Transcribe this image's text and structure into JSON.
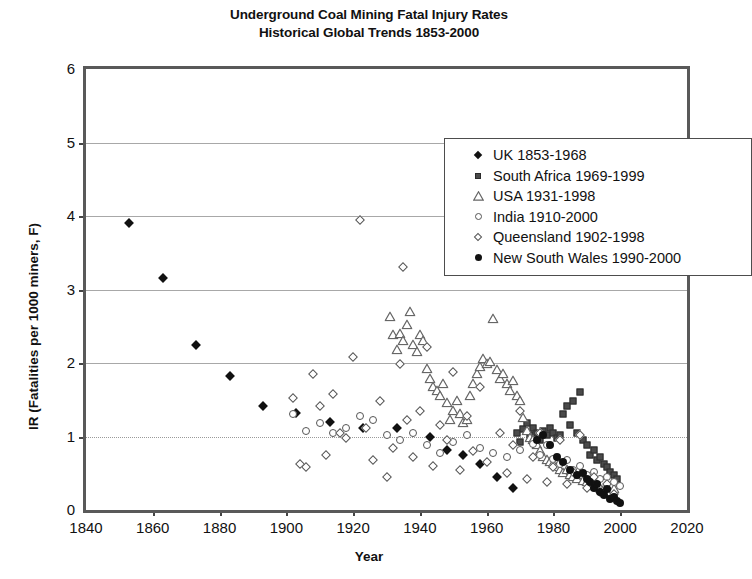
{
  "chart_data": {
    "type": "scatter",
    "title": "Underground Coal Mining Fatal Injury Rates",
    "subtitle": "Historical Global Trends 1853-2000",
    "xlabel": "Year",
    "ylabel": "IR (Fatalities per 1000 miners, F)",
    "xlim": [
      1840,
      2020
    ],
    "ylim": [
      0,
      6
    ],
    "xticks": [
      1840,
      1860,
      1880,
      1900,
      1920,
      1940,
      1960,
      1980,
      2000,
      2020
    ],
    "yticks": [
      0,
      1,
      2,
      3,
      4,
      5,
      6
    ],
    "grid": "horizontal gridlines at 1 (dotted), 2, 3, 4, 5 (solid gray)",
    "legend_position": "top-center-right inside plot",
    "series": [
      {
        "name": "UK 1853-1968",
        "marker": "diamond-filled",
        "color": "#111111",
        "points": [
          [
            1853,
            3.9
          ],
          [
            1863,
            3.15
          ],
          [
            1873,
            2.25
          ],
          [
            1883,
            1.82
          ],
          [
            1893,
            1.42
          ],
          [
            1903,
            1.32
          ],
          [
            1913,
            1.2
          ],
          [
            1923,
            1.12
          ],
          [
            1933,
            1.12
          ],
          [
            1943,
            1.0
          ],
          [
            1948,
            0.82
          ],
          [
            1953,
            0.75
          ],
          [
            1958,
            0.62
          ],
          [
            1963,
            0.45
          ],
          [
            1968,
            0.3
          ]
        ]
      },
      {
        "name": "South Africa 1969-1999",
        "marker": "square-filled",
        "color": "#4a4a4a",
        "points": [
          [
            1969,
            1.05
          ],
          [
            1970,
            0.92
          ],
          [
            1971,
            1.1
          ],
          [
            1972,
            1.18
          ],
          [
            1973,
            1.02
          ],
          [
            1974,
            1.12
          ],
          [
            1975,
            1.05
          ],
          [
            1976,
            0.95
          ],
          [
            1977,
            1.08
          ],
          [
            1978,
            1.02
          ],
          [
            1979,
            1.12
          ],
          [
            1980,
            1.05
          ],
          [
            1981,
            0.98
          ],
          [
            1982,
            1.02
          ],
          [
            1983,
            1.3
          ],
          [
            1984,
            1.42
          ],
          [
            1985,
            1.15
          ],
          [
            1986,
            1.48
          ],
          [
            1987,
            1.05
          ],
          [
            1988,
            1.6
          ],
          [
            1989,
            0.95
          ],
          [
            1990,
            0.88
          ],
          [
            1991,
            0.75
          ],
          [
            1992,
            0.82
          ],
          [
            1993,
            0.68
          ],
          [
            1994,
            0.72
          ],
          [
            1995,
            0.62
          ],
          [
            1996,
            0.58
          ],
          [
            1997,
            0.52
          ],
          [
            1998,
            0.48
          ],
          [
            1999,
            0.42
          ]
        ]
      },
      {
        "name": "USA 1931-1998",
        "marker": "triangle-open",
        "color": "#666666",
        "points": [
          [
            1931,
            2.62
          ],
          [
            1932,
            2.38
          ],
          [
            1933,
            2.18
          ],
          [
            1934,
            2.4
          ],
          [
            1935,
            2.3
          ],
          [
            1936,
            2.52
          ],
          [
            1937,
            2.7
          ],
          [
            1938,
            2.25
          ],
          [
            1939,
            2.15
          ],
          [
            1940,
            2.38
          ],
          [
            1941,
            2.3
          ],
          [
            1942,
            1.92
          ],
          [
            1943,
            1.78
          ],
          [
            1944,
            1.68
          ],
          [
            1945,
            1.62
          ],
          [
            1946,
            1.55
          ],
          [
            1947,
            1.72
          ],
          [
            1948,
            1.45
          ],
          [
            1949,
            1.22
          ],
          [
            1950,
            1.35
          ],
          [
            1951,
            1.48
          ],
          [
            1952,
            1.3
          ],
          [
            1953,
            1.18
          ],
          [
            1954,
            1.22
          ],
          [
            1955,
            1.55
          ],
          [
            1956,
            1.72
          ],
          [
            1957,
            1.85
          ],
          [
            1958,
            1.95
          ],
          [
            1959,
            2.05
          ],
          [
            1960,
            1.98
          ],
          [
            1961,
            2.02
          ],
          [
            1962,
            2.6
          ],
          [
            1963,
            1.9
          ],
          [
            1964,
            1.78
          ],
          [
            1965,
            1.85
          ],
          [
            1966,
            1.72
          ],
          [
            1967,
            1.62
          ],
          [
            1968,
            1.75
          ],
          [
            1969,
            1.55
          ],
          [
            1970,
            1.48
          ],
          [
            1971,
            1.25
          ],
          [
            1972,
            1.08
          ],
          [
            1973,
            0.98
          ],
          [
            1974,
            0.95
          ],
          [
            1975,
            0.88
          ],
          [
            1976,
            0.8
          ],
          [
            1977,
            0.72
          ],
          [
            1978,
            0.68
          ],
          [
            1979,
            0.65
          ],
          [
            1980,
            0.62
          ],
          [
            1981,
            0.58
          ],
          [
            1982,
            0.55
          ],
          [
            1983,
            0.5
          ],
          [
            1984,
            0.55
          ],
          [
            1985,
            0.48
          ],
          [
            1986,
            0.45
          ],
          [
            1987,
            0.42
          ],
          [
            1988,
            0.48
          ],
          [
            1989,
            0.4
          ],
          [
            1990,
            0.38
          ],
          [
            1991,
            0.35
          ],
          [
            1992,
            0.32
          ],
          [
            1993,
            0.35
          ],
          [
            1994,
            0.3
          ],
          [
            1995,
            0.28
          ],
          [
            1996,
            0.3
          ],
          [
            1997,
            0.25
          ],
          [
            1998,
            0.28
          ]
        ]
      },
      {
        "name": "India 1910-2000",
        "marker": "circle-open",
        "color": "#555555",
        "points": [
          [
            1910,
            1.18
          ],
          [
            1914,
            1.05
          ],
          [
            1918,
            1.12
          ],
          [
            1922,
            1.28
          ],
          [
            1926,
            1.22
          ],
          [
            1930,
            1.02
          ],
          [
            1934,
            0.95
          ],
          [
            1938,
            1.05
          ],
          [
            1942,
            0.88
          ],
          [
            1946,
            0.78
          ],
          [
            1950,
            0.92
          ],
          [
            1954,
            1.02
          ],
          [
            1958,
            0.85
          ],
          [
            1962,
            0.78
          ],
          [
            1966,
            0.72
          ],
          [
            1970,
            0.82
          ],
          [
            1974,
            0.9
          ],
          [
            1976,
            0.75
          ],
          [
            1978,
            0.88
          ],
          [
            1980,
            0.7
          ],
          [
            1982,
            0.62
          ],
          [
            1984,
            0.68
          ],
          [
            1986,
            0.55
          ],
          [
            1988,
            0.6
          ],
          [
            1990,
            0.48
          ],
          [
            1992,
            0.52
          ],
          [
            1994,
            0.42
          ],
          [
            1996,
            0.45
          ],
          [
            1998,
            0.38
          ],
          [
            2000,
            0.32
          ],
          [
            1902,
            1.3
          ],
          [
            1906,
            1.08
          ]
        ]
      },
      {
        "name": "Queensland 1902-1998",
        "marker": "diamond-open",
        "color": "#555555",
        "points": [
          [
            1902,
            1.52
          ],
          [
            1904,
            0.62
          ],
          [
            1906,
            0.58
          ],
          [
            1908,
            1.85
          ],
          [
            1910,
            1.42
          ],
          [
            1912,
            0.75
          ],
          [
            1914,
            1.58
          ],
          [
            1916,
            1.05
          ],
          [
            1918,
            0.98
          ],
          [
            1920,
            2.08
          ],
          [
            1922,
            3.95
          ],
          [
            1924,
            1.12
          ],
          [
            1926,
            0.68
          ],
          [
            1928,
            1.48
          ],
          [
            1930,
            0.45
          ],
          [
            1932,
            0.85
          ],
          [
            1934,
            1.98
          ],
          [
            1935,
            3.3
          ],
          [
            1936,
            1.22
          ],
          [
            1938,
            0.72
          ],
          [
            1940,
            1.35
          ],
          [
            1942,
            2.22
          ],
          [
            1944,
            0.6
          ],
          [
            1946,
            1.15
          ],
          [
            1948,
            0.95
          ],
          [
            1950,
            1.88
          ],
          [
            1952,
            0.55
          ],
          [
            1954,
            1.28
          ],
          [
            1956,
            0.8
          ],
          [
            1958,
            1.68
          ],
          [
            1960,
            0.65
          ],
          [
            1962,
            3.25
          ],
          [
            1964,
            1.05
          ],
          [
            1966,
            0.5
          ],
          [
            1968,
            0.88
          ],
          [
            1970,
            1.35
          ],
          [
            1972,
            0.42
          ],
          [
            1974,
            0.72
          ],
          [
            1976,
            1.05
          ],
          [
            1978,
            0.38
          ],
          [
            1980,
            0.58
          ],
          [
            1982,
            0.95
          ],
          [
            1984,
            0.35
          ],
          [
            1986,
            0.52
          ],
          [
            1988,
            1.02
          ],
          [
            1990,
            0.3
          ],
          [
            1992,
            0.45
          ],
          [
            1994,
            0.25
          ],
          [
            1996,
            0.35
          ],
          [
            1998,
            0.22
          ]
        ]
      },
      {
        "name": "New South Wales 1990-2000",
        "marker": "circle-filled",
        "color": "#111111",
        "points": [
          [
            1990,
            0.42
          ],
          [
            1991,
            0.38
          ],
          [
            1992,
            0.3
          ],
          [
            1993,
            0.35
          ],
          [
            1994,
            0.25
          ],
          [
            1995,
            0.2
          ],
          [
            1996,
            0.28
          ],
          [
            1997,
            0.15
          ],
          [
            1998,
            0.18
          ],
          [
            1999,
            0.12
          ],
          [
            2000,
            0.1
          ],
          [
            1975,
            0.95
          ],
          [
            1977,
            1.02
          ],
          [
            1979,
            0.88
          ],
          [
            1981,
            0.72
          ],
          [
            1983,
            0.65
          ],
          [
            1985,
            0.55
          ],
          [
            1987,
            0.48
          ],
          [
            1989,
            0.5
          ]
        ]
      }
    ]
  }
}
